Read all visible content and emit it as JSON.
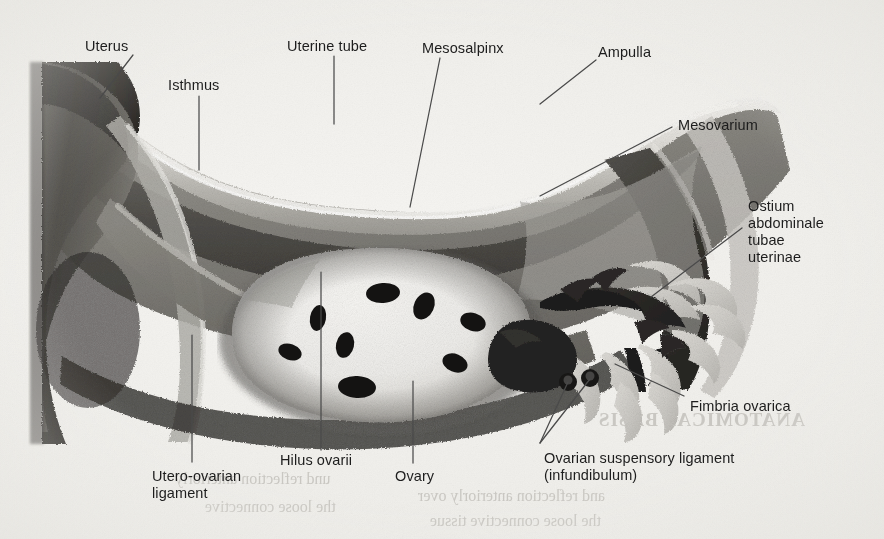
{
  "figure": {
    "kind": "anatomical-illustration",
    "style": "grayscale airbrush / stipple halftone scan from a printed textbook page",
    "background_color": "#efeeea",
    "ink_color": "#1d1d1d",
    "leader_line_color": "#4a4a4a"
  },
  "labels": [
    {
      "id": "uterus",
      "lines": [
        "Uterus"
      ],
      "x": 85,
      "y": 38,
      "align": "left"
    },
    {
      "id": "isthmus",
      "lines": [
        "Isthmus"
      ],
      "x": 168,
      "y": 77,
      "align": "left"
    },
    {
      "id": "uterine-tube",
      "lines": [
        "Uterine tube"
      ],
      "x": 287,
      "y": 38,
      "align": "left"
    },
    {
      "id": "mesosalpinx",
      "lines": [
        "Mesosalpinx"
      ],
      "x": 422,
      "y": 40,
      "align": "left"
    },
    {
      "id": "ampulla",
      "lines": [
        "Ampulla"
      ],
      "x": 598,
      "y": 44,
      "align": "left"
    },
    {
      "id": "mesovarium",
      "lines": [
        "Mesovarium"
      ],
      "x": 678,
      "y": 117,
      "align": "left"
    },
    {
      "id": "ostium-abdominale",
      "lines": [
        "Ostium",
        "abdominale",
        "tubae",
        "uterinae"
      ],
      "x": 748,
      "y": 198,
      "align": "left"
    },
    {
      "id": "fimbria-ovarica",
      "lines": [
        "Fimbria ovarica"
      ],
      "x": 690,
      "y": 398,
      "align": "left"
    },
    {
      "id": "hilus-ovarii",
      "lines": [
        "Hilus ovarii"
      ],
      "x": 280,
      "y": 452,
      "align": "left"
    },
    {
      "id": "ovary",
      "lines": [
        "Ovary"
      ],
      "x": 395,
      "y": 468,
      "align": "left"
    },
    {
      "id": "utero-ovarian-lig",
      "lines": [
        "Utero-ovarian",
        "ligament"
      ],
      "x": 152,
      "y": 468,
      "align": "left"
    },
    {
      "id": "ovarian-susp-lig",
      "lines": [
        "Ovarian suspensory ligament",
        "(infundibulum)"
      ],
      "x": 544,
      "y": 450,
      "align": "left"
    }
  ],
  "leader_lines": [
    {
      "id": "leader-uterus",
      "points": "133,55 100,98"
    },
    {
      "id": "leader-isthmus",
      "points": "199,96 199,170"
    },
    {
      "id": "leader-uterine-tube",
      "points": "334,56 334,124"
    },
    {
      "id": "leader-mesosalpinx",
      "points": "440,58 410,207"
    },
    {
      "id": "leader-ampulla",
      "points": "596,60 540,104"
    },
    {
      "id": "leader-mesovarium",
      "points": "672,127 540,196"
    },
    {
      "id": "leader-ostium",
      "points": "742,228 651,297"
    },
    {
      "id": "leader-fimbria",
      "points": "684,396 615,364"
    },
    {
      "id": "leader-hilus",
      "points": "321,450 321,272"
    },
    {
      "id": "leader-ovary",
      "points": "413,463 413,381"
    },
    {
      "id": "leader-utero-ovarian",
      "points": "192,462 192,335"
    },
    {
      "id": "leader-susp-lig-a",
      "points": "540,443 568,382"
    },
    {
      "id": "leader-susp-lig-b",
      "points": "540,443 590,379"
    }
  ],
  "bleed_through_text": [
    {
      "id": "bleed-title",
      "text": "ANATOMICAL BASIS"
    },
    {
      "id": "bleed-line-1",
      "text": "and reflection anteriorly over"
    },
    {
      "id": "bleed-line-2",
      "text": "the loose connective tissue"
    },
    {
      "id": "bleed-line-3",
      "text": "und reflection anteriorly"
    },
    {
      "id": "bleed-line-4",
      "text": "the loose connective"
    }
  ],
  "anatomy_parts": [
    {
      "id": "uterus-body",
      "name": "Uterus (body, cut at left margin)"
    },
    {
      "id": "isthmus-segment",
      "name": "Isthmus of uterine tube"
    },
    {
      "id": "uterine-tube",
      "name": "Uterine tube"
    },
    {
      "id": "ampulla-segment",
      "name": "Ampulla of uterine tube"
    },
    {
      "id": "mesosalpinx-fold",
      "name": "Mesosalpinx (broad ligament fold)"
    },
    {
      "id": "mesovarium-fold",
      "name": "Mesovarium"
    },
    {
      "id": "ovary-body",
      "name": "Ovary with follicles"
    },
    {
      "id": "hilus-ovarii",
      "name": "Hilus ovarii"
    },
    {
      "id": "utero-ovarian-lig",
      "name": "Utero-ovarian ligament"
    },
    {
      "id": "infundibulum",
      "name": "Infundibulum / ovarian suspensory ligament"
    },
    {
      "id": "fimbriae",
      "name": "Fimbriae of uterine tube"
    },
    {
      "id": "fimbria-ovarica",
      "name": "Fimbria ovarica"
    },
    {
      "id": "ostium-abdominale",
      "name": "Ostium abdominale tubae uterinae"
    }
  ],
  "ovary_follicles": [
    {
      "cx": 383,
      "cy": 293,
      "rx": 17,
      "ry": 10,
      "rot": -4
    },
    {
      "cx": 424,
      "cy": 306,
      "rx": 10,
      "ry": 14,
      "rot": 25
    },
    {
      "cx": 473,
      "cy": 322,
      "rx": 13,
      "ry": 9,
      "rot": 18
    },
    {
      "cx": 318,
      "cy": 318,
      "rx": 8,
      "ry": 13,
      "rot": 10
    },
    {
      "cx": 345,
      "cy": 345,
      "rx": 9,
      "ry": 13,
      "rot": 12
    },
    {
      "cx": 290,
      "cy": 352,
      "rx": 12,
      "ry": 8,
      "rot": 20
    },
    {
      "cx": 455,
      "cy": 363,
      "rx": 13,
      "ry": 9,
      "rot": 22
    },
    {
      "cx": 357,
      "cy": 387,
      "rx": 19,
      "ry": 11,
      "rot": 3
    }
  ]
}
